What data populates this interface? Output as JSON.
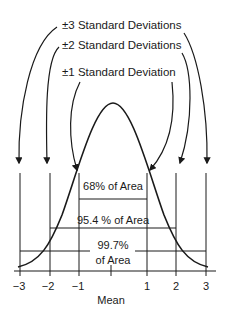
{
  "diagram": {
    "labels": {
      "sd3": "±3 Standard Deviations",
      "sd2": "±2 Standard Deviations",
      "sd1": "±1 Standard Deviation"
    },
    "areas": {
      "sd1": "68% of Area",
      "sd2": "95.4 % of Area",
      "sd3_line1": "99.7%",
      "sd3_line2": "of Area"
    },
    "axis": {
      "ticks": [
        "−3",
        "−2",
        "−1",
        "1",
        "2",
        "3"
      ],
      "center_label": "Mean"
    },
    "colors": {
      "stroke": "#1a1a1a",
      "background": "#ffffff"
    }
  }
}
